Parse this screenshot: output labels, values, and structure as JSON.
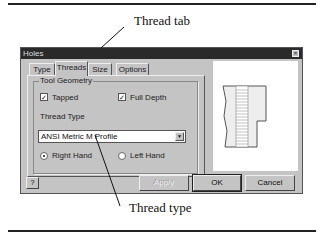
{
  "callouts": {
    "thread_tab": "Thread tab",
    "thread_type": "Thread type"
  },
  "dialog": {
    "title": "Holes",
    "close_glyph": "×",
    "tabs": [
      {
        "label": "Type",
        "active": false
      },
      {
        "label": "Threads",
        "active": true
      },
      {
        "label": "Size",
        "active": false
      },
      {
        "label": "Options",
        "active": false
      }
    ],
    "tool_geometry": {
      "label": "Tool Geometry",
      "tapped": {
        "label": "Tapped",
        "checked": true,
        "glyph": "✓"
      },
      "full_depth": {
        "label": "Full Depth",
        "checked": true,
        "glyph": "✓"
      },
      "thread_type_label": "Thread Type",
      "thread_type_value": "ANSI Metric M Profile",
      "dropdown_glyph": "▼",
      "right_hand": {
        "label": "Right Hand",
        "selected": true
      },
      "left_hand": {
        "label": "Left Hand",
        "selected": false
      }
    },
    "buttons": {
      "help_glyph": "?",
      "apply": "Apply",
      "ok": "OK",
      "cancel": "Cancel"
    }
  }
}
